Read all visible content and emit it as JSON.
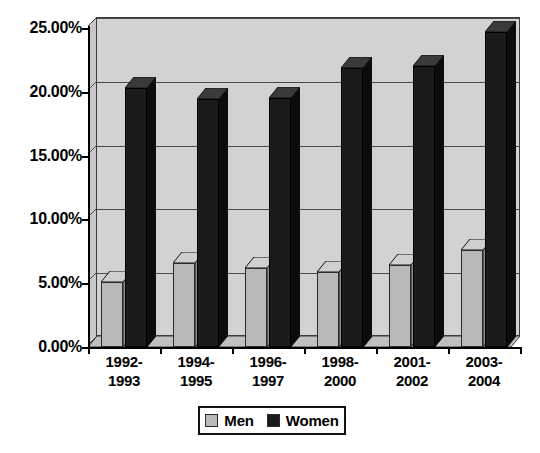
{
  "chart_data": {
    "type": "bar",
    "title": "",
    "subtitle": "",
    "xlabel": "",
    "ylabel": "",
    "categories": [
      "1992-\n1993",
      "1994-\n1995",
      "1996-\n1997",
      "1998-\n2000",
      "2001-\n2002",
      "2003-\n2004"
    ],
    "category_lines": [
      [
        "1992-",
        "1993"
      ],
      [
        "1994-",
        "1995"
      ],
      [
        "1996-",
        "1997"
      ],
      [
        "1998-",
        "2000"
      ],
      [
        "2001-",
        "2002"
      ],
      [
        "2003-",
        "2004"
      ]
    ],
    "series": [
      {
        "name": "Men",
        "color": "#b9b9b9",
        "values": [
          5.1,
          6.6,
          6.2,
          5.9,
          6.4,
          7.6
        ]
      },
      {
        "name": "Women",
        "color": "#1b1b1b",
        "values": [
          20.3,
          19.4,
          19.5,
          21.9,
          22.0,
          24.7
        ]
      }
    ],
    "ylim": [
      0,
      25
    ],
    "ytick_values": [
      0,
      5,
      10,
      15,
      20,
      25
    ],
    "ytick_labels": [
      "0.00%",
      "5.00%",
      "10.00%",
      "15.00%",
      "20.00%",
      "25.00%"
    ],
    "grid": true,
    "legend_position": "bottom",
    "style_3d": true,
    "plot_background": "#d2d2d2",
    "page_background": "#ffffff"
  },
  "legend": {
    "items": [
      {
        "label": "Men",
        "swatch_color": "#b9b9b9"
      },
      {
        "label": "Women",
        "swatch_color": "#1b1b1b"
      }
    ]
  }
}
